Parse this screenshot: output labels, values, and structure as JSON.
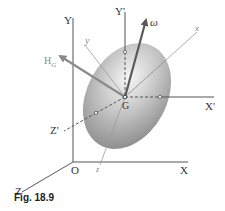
{
  "figure": {
    "caption": "Fig. 18.9",
    "labels": {
      "Y": "Y",
      "X": "X",
      "Z": "Z",
      "O": "O",
      "Y_prime": "Y'",
      "X_prime": "X'",
      "Z_prime": "Z'",
      "G": "G",
      "omega": "ω",
      "H": "H",
      "H_sub": "G",
      "x_body": "x",
      "y_body": "y",
      "z_body": "z"
    },
    "colors": {
      "axis": "#555555",
      "vector": "#707070",
      "body_axis": "#9a9a9a",
      "ellipsoid_light": "#f4f4f4",
      "ellipsoid_dark": "#8c8c8c"
    }
  }
}
